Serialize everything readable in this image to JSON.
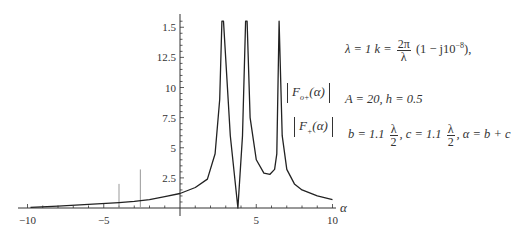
{
  "chart_data": {
    "type": "line",
    "title": "",
    "xlabel": "α",
    "ylabel": "",
    "xlim": [
      -10,
      10
    ],
    "ylim": [
      0,
      15.5
    ],
    "grid": false,
    "x_ticks": [
      "-10",
      "-5",
      "5",
      "10"
    ],
    "y_ticks": [
      "2.5",
      "5",
      "7.5",
      "10",
      "12.5",
      "1.5"
    ],
    "series": [
      {
        "name": "|F_{o+}(α)| , |F_+(α)|",
        "color": "#222222",
        "x": [
          -9.8,
          -8,
          -6,
          -4,
          -3,
          -2,
          -1,
          0,
          1,
          1.8,
          2.3,
          2.6,
          2.75,
          2.85,
          3.3,
          3.8,
          4.1,
          4.3,
          4.4,
          4.6,
          5,
          5.5,
          5.9,
          6.2,
          6.35,
          6.5,
          6.7,
          7,
          7.5,
          8,
          9,
          10
        ],
        "y": [
          0.05,
          0.15,
          0.3,
          0.45,
          0.55,
          0.7,
          0.95,
          1.2,
          1.7,
          2.4,
          4.5,
          9,
          15.5,
          15.5,
          6,
          0.0,
          6,
          15.5,
          15.5,
          7.5,
          4,
          2.9,
          2.8,
          3.2,
          4.5,
          15.5,
          6,
          3.2,
          2.0,
          1.5,
          1.0,
          0.7
        ]
      }
    ],
    "annotations": {
      "spikes": [
        {
          "x": -4.0,
          "height": 2.0
        },
        {
          "x": -2.6,
          "height": 3.2
        }
      ]
    },
    "legend": [
      "|F_{o+}(α)|",
      "|F_+(α)|"
    ]
  },
  "legend": {
    "item1_main": "F",
    "item1_sub": "o+",
    "item1_arg": "(α)",
    "item2_main": "F",
    "item2_sub": "+",
    "item2_arg": "(α)"
  },
  "equations": {
    "line1_prefix": "λ = 1   k =",
    "line1_frac_num": "2π",
    "line1_frac_den": "λ",
    "line1_suffix": "(1 − j10",
    "line1_exp": "−8",
    "line1_end": "),",
    "line2": "A = 20,   h = 0.5",
    "line3_b": "b = 1.1",
    "line3_frac_num": "λ",
    "line3_frac_den": "2",
    "line3_c": ",   c = 1.1",
    "line3_frac2_num": "λ",
    "line3_frac2_den": "2",
    "line3_end": ",   α = b + c"
  }
}
